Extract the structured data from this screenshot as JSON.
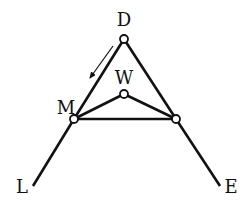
{
  "diagram": {
    "type": "mechanical-linkage",
    "labels": {
      "D": "D",
      "W": "W",
      "M": "M",
      "L": "L",
      "E": "E"
    },
    "nodes": {
      "D": {
        "x": 124,
        "y": 39
      },
      "W": {
        "x": 124,
        "y": 94
      },
      "M": {
        "x": 74,
        "y": 119
      },
      "R": {
        "x": 176,
        "y": 119
      }
    },
    "endpoints": {
      "L": {
        "x": 33,
        "y": 186
      },
      "E": {
        "x": 220,
        "y": 186
      }
    },
    "arrow": {
      "from": {
        "x": 113,
        "y": 46
      },
      "to": {
        "x": 90,
        "y": 78
      },
      "meaning": "motion direction from D toward M"
    },
    "colors": {
      "stroke": "#111111",
      "node_fill": "#ffffff"
    }
  }
}
